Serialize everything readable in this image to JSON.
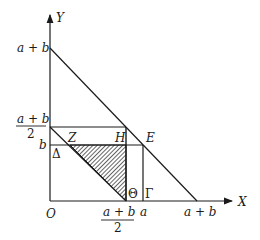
{
  "diagram": {
    "type": "geometric-region-plot",
    "axes": {
      "x_label": "X",
      "y_label": "Y",
      "origin_label": "O"
    },
    "y_ticks": [
      {
        "label": "a + b"
      },
      {
        "label_num": "a + b",
        "label_den": "2"
      },
      {
        "label": "b"
      }
    ],
    "x_ticks": [
      {
        "label_num": "a + b",
        "label_den": "2"
      },
      {
        "label": "a"
      },
      {
        "label": "a + b"
      }
    ],
    "points": {
      "Z": "Z",
      "H": "H",
      "E": "E",
      "Delta": "Δ",
      "Theta": "Θ",
      "Gamma": "Γ"
    },
    "shaded_region": "triangle Z-H-Θ (hatched)"
  }
}
